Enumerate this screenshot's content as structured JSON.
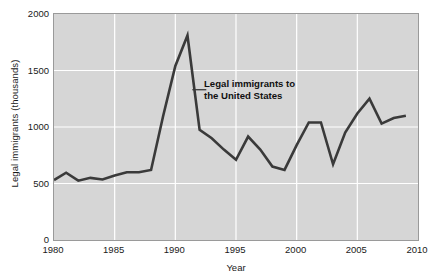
{
  "chart_data": {
    "type": "line",
    "title": "",
    "xlabel": "Year",
    "ylabel": "Legal immigrants (thousands)",
    "xlim": [
      1980,
      2010
    ],
    "ylim": [
      0,
      2000
    ],
    "xticks": [
      1980,
      1985,
      1990,
      1995,
      2000,
      2005,
      2010
    ],
    "xtick_labels": [
      "1980",
      "1985",
      "1990",
      "1995",
      "2000",
      "2005",
      "2010"
    ],
    "yticks": [
      0,
      500,
      1000,
      1500,
      2000
    ],
    "ytick_labels": [
      "0",
      "500",
      "1000",
      "1500",
      "2000"
    ],
    "grid": true,
    "grid_color": "#ffffff",
    "plot_background": "#d6d6d6",
    "line_color": "#3a3a3a",
    "line_width": 2.6,
    "legend": "none",
    "annotations": [
      {
        "name": "series-callout",
        "text_line1": "Legal immigrants to",
        "text_line2": "the United States",
        "leader_from_x": 1991.4,
        "leader_from_y": 1330,
        "bold": true
      }
    ],
    "series": [
      {
        "name": "Legal immigrants to the United States",
        "x": [
          1980,
          1981,
          1982,
          1983,
          1984,
          1985,
          1986,
          1987,
          1988,
          1989,
          1990,
          1991,
          1992,
          1993,
          1994,
          1995,
          1996,
          1997,
          1998,
          1999,
          2000,
          2001,
          2002,
          2003,
          2004,
          2005,
          2006,
          2007,
          2008,
          2009
        ],
        "values": [
          530,
          595,
          525,
          550,
          535,
          570,
          600,
          600,
          620,
          1100,
          1540,
          1810,
          975,
          900,
          800,
          710,
          915,
          800,
          650,
          620,
          840,
          1040,
          1040,
          670,
          950,
          1120,
          1250,
          1030,
          1080,
          1100
        ]
      }
    ]
  }
}
